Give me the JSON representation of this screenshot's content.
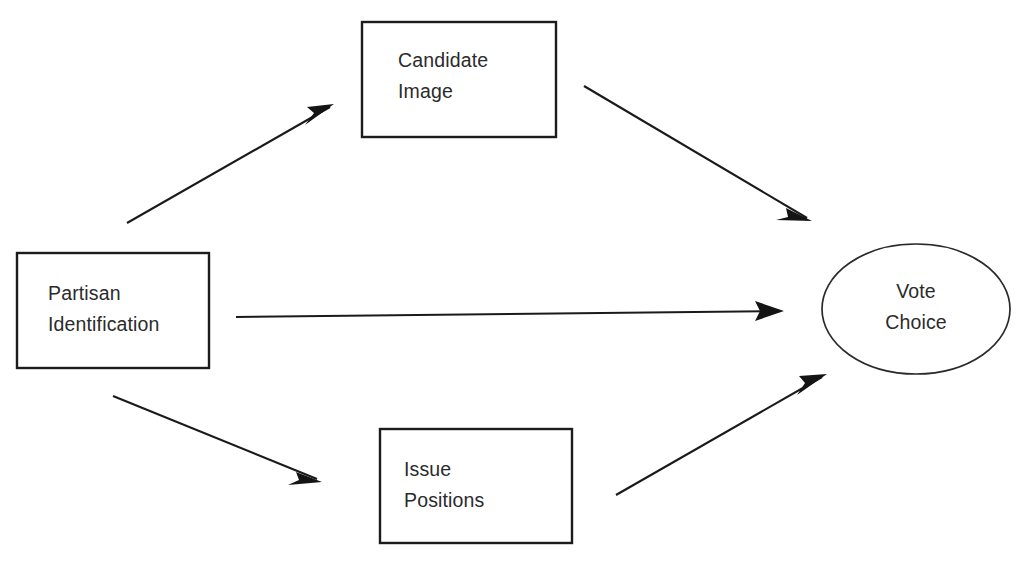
{
  "diagram": {
    "background_color": "#ffffff",
    "stroke_color": "#1a1a1a",
    "text_color": "#2b2b2b",
    "nodes": [
      {
        "id": "candidate-image",
        "shape": "rectangle",
        "label_line1": "Candidate",
        "label_line2": "Image",
        "x": 362,
        "y": 22,
        "width": 194,
        "height": 115
      },
      {
        "id": "partisan-identification",
        "shape": "rectangle",
        "label_line1": "Partisan",
        "label_line2": "Identification",
        "x": 17,
        "y": 253,
        "width": 192,
        "height": 115
      },
      {
        "id": "issue-positions",
        "shape": "rectangle",
        "label_line1": "Issue",
        "label_line2": "Positions",
        "x": 380,
        "y": 429,
        "width": 192,
        "height": 114
      },
      {
        "id": "vote-choice",
        "shape": "ellipse",
        "label_line1": "Vote",
        "label_line2": "Choice",
        "cx": 916,
        "cy": 309,
        "rx": 94,
        "ry": 65
      }
    ],
    "edges": [
      {
        "id": "partisan-to-candidate-image",
        "from": "partisan-identification",
        "to": "candidate-image",
        "x1": 127,
        "y1": 223,
        "x2": 330,
        "y2": 107
      },
      {
        "id": "candidate-image-to-vote-choice",
        "from": "candidate-image",
        "to": "vote-choice",
        "x1": 584,
        "y1": 86,
        "x2": 807,
        "y2": 218
      },
      {
        "id": "partisan-to-vote-choice",
        "from": "partisan-identification",
        "to": "vote-choice",
        "x1": 236,
        "y1": 317,
        "x2": 781,
        "y2": 311
      },
      {
        "id": "partisan-to-issue-positions",
        "from": "partisan-identification",
        "to": "issue-positions",
        "x1": 113,
        "y1": 396,
        "x2": 317,
        "y2": 479
      },
      {
        "id": "issue-positions-to-vote-choice",
        "from": "issue-positions",
        "to": "vote-choice",
        "x1": 616,
        "y1": 495,
        "x2": 822,
        "y2": 377
      }
    ]
  }
}
